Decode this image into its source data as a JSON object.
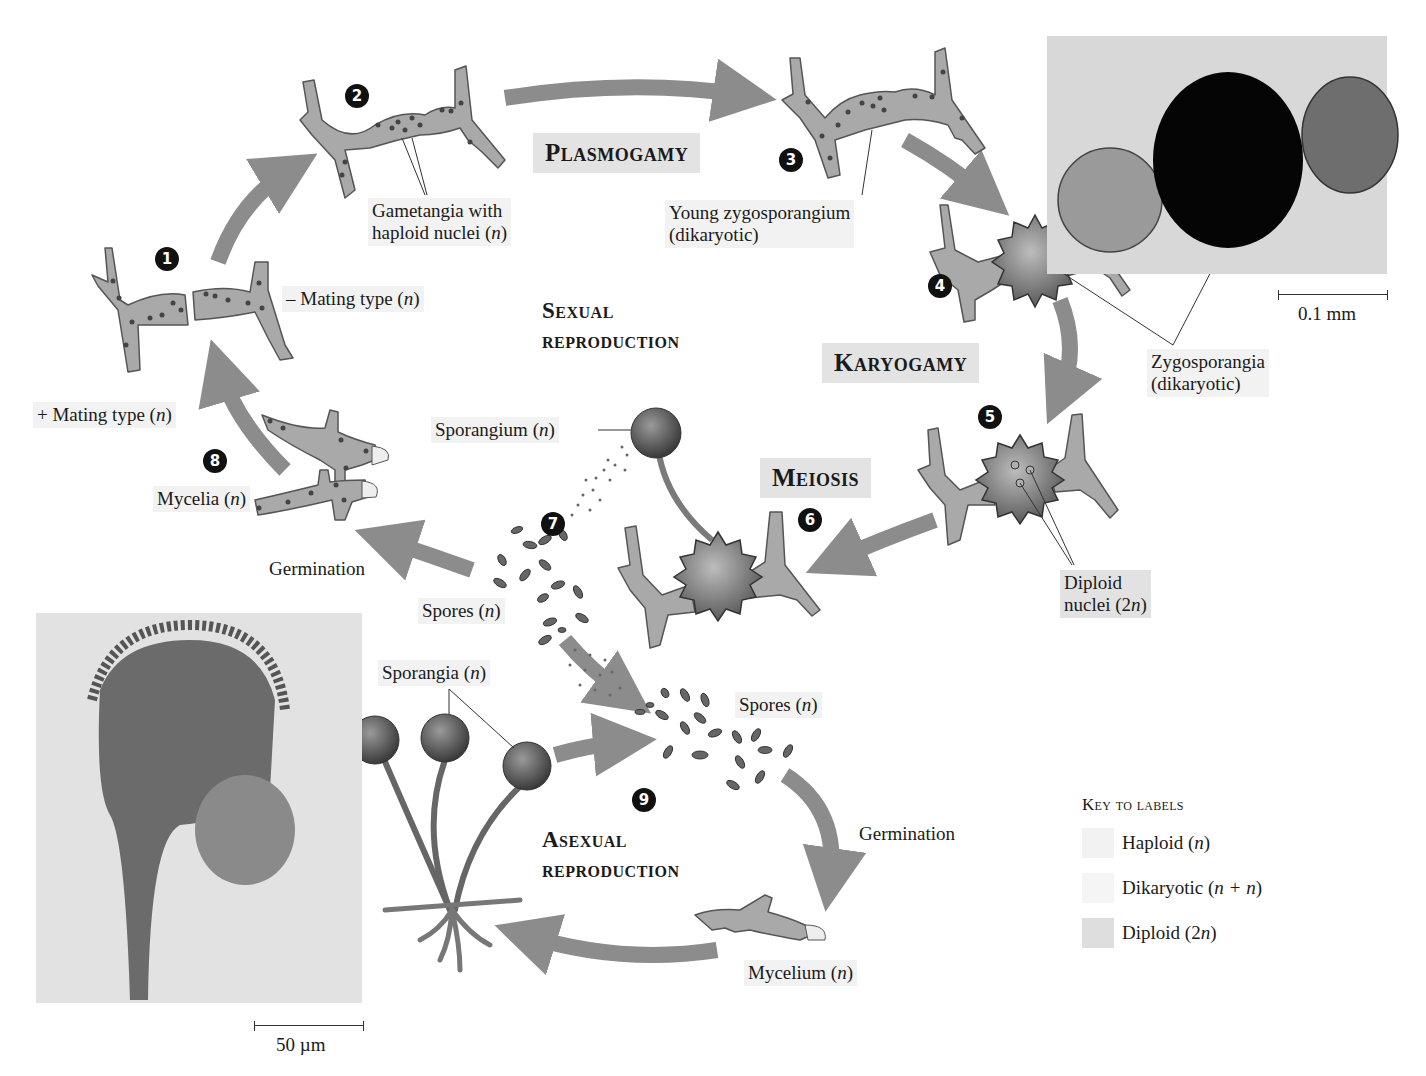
{
  "stages": {
    "plasmogamy": "Plasmogamy",
    "karyogamy": "Karyogamy",
    "meiosis": "Meiosis",
    "sexual_line1": "Sexual",
    "sexual_line2": "reproduction",
    "asexual_line1": "Asexual",
    "asexual_line2": "reproduction"
  },
  "steps": [
    "1",
    "2",
    "3",
    "4",
    "5",
    "6",
    "7",
    "8",
    "9"
  ],
  "labels": {
    "gametangia_line1": "Gametangia with",
    "gametangia_line2_pre": "haploid nuclei (",
    "gametangia_line2_var": "n",
    "gametangia_line2_post": ")",
    "young_zygo_line1": "Young zygosporangium",
    "young_zygo_line2": "(dikaryotic)",
    "minus_mating_pre": "– Mating type (",
    "minus_mating_var": "n",
    "minus_mating_post": ")",
    "plus_mating_pre": "+ Mating type (",
    "plus_mating_var": "n",
    "plus_mating_post": ")",
    "zygosporangia_line1": "Zygosporangia",
    "zygosporangia_line2": "(dikaryotic)",
    "sporangium_pre": "Sporangium (",
    "sporangium_var": "n",
    "sporangium_post": ")",
    "mycelia_pre": "Mycelia (",
    "mycelia_var": "n",
    "mycelia_post": ")",
    "germination_1": "Germination",
    "germination_2": "Germination",
    "spores1_pre": "Spores (",
    "spores1_var": "n",
    "spores1_post": ")",
    "spores2_pre": "Spores (",
    "spores2_var": "n",
    "spores2_post": ")",
    "diploid_line1": "Diploid",
    "diploid_line2_pre": "nuclei (2",
    "diploid_line2_var": "n",
    "diploid_line2_post": ")",
    "sporangia_pre": "Sporangia (",
    "sporangia_var": "n",
    "sporangia_post": ")",
    "mycelium_pre": "Mycelium (",
    "mycelium_var": "n",
    "mycelium_post": ")"
  },
  "scale_bars": {
    "top_right": "0.1 mm",
    "bottom_left": "50 µm"
  },
  "key": {
    "title": "Key to labels",
    "items": [
      {
        "label_pre": "Haploid (",
        "label_var": "n",
        "label_post": ")",
        "color": "#f2f2f2"
      },
      {
        "label_pre": "Dikaryotic (",
        "label_var": "n + n",
        "label_post": ")",
        "color": "#f5f5f5"
      },
      {
        "label_pre": "Diploid (2",
        "label_var": "n",
        "label_post": ")",
        "color": "#dedede"
      }
    ]
  },
  "colors": {
    "arrow": "#8c8c8c",
    "hypha_fill": "#a9a9a9",
    "hypha_stroke": "#555555",
    "haploid_bg": "#f2f2f2",
    "stage_bg": "#e3e3e3"
  }
}
